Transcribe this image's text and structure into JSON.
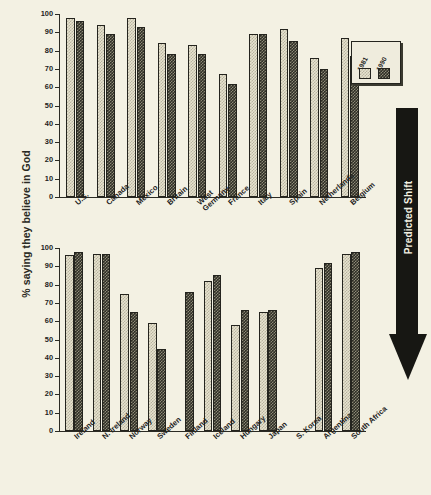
{
  "figure": {
    "ylabel": "% saying they believe in God",
    "annotation": "Predicted Shift",
    "background_color": "#f3f1e3",
    "bar_light_color": "#e6e3cf",
    "bar_dark_color": "#2e2e26",
    "arrow_color": "#171713"
  },
  "legend": {
    "entries": [
      {
        "label": "1981",
        "swatch": "light-checker-swatch"
      },
      {
        "label": "1990",
        "swatch": "dark-checker-swatch"
      }
    ]
  },
  "axis": {
    "ticks": [
      "0",
      "10",
      "20",
      "30",
      "40",
      "50",
      "60",
      "70",
      "80",
      "90",
      "100"
    ]
  },
  "chart_data": [
    {
      "type": "bar",
      "title": "",
      "panel": "top",
      "xlabel": "",
      "ylabel": "% saying they believe in God",
      "ylim": [
        0,
        100
      ],
      "yticks": [
        0,
        10,
        20,
        30,
        40,
        50,
        60,
        70,
        80,
        90,
        100
      ],
      "grid": false,
      "legend_position": "upper right",
      "categories": [
        "U.S.",
        "Canada",
        "Mexico",
        "Britain",
        "West\nGermany",
        "France",
        "Italy",
        "Spain",
        "Netherlands",
        "Belgium"
      ],
      "series": [
        {
          "name": "1981",
          "values": [
            98,
            94,
            98,
            84,
            83,
            67,
            89,
            92,
            76,
            87
          ]
        },
        {
          "name": "1990",
          "values": [
            96,
            89,
            93,
            78,
            78,
            62,
            89,
            85,
            70,
            77
          ]
        }
      ]
    },
    {
      "type": "bar",
      "title": "",
      "panel": "bottom",
      "xlabel": "",
      "ylabel": "% saying they believe in God",
      "ylim": [
        0,
        100
      ],
      "yticks": [
        0,
        10,
        20,
        30,
        40,
        50,
        60,
        70,
        80,
        90,
        100
      ],
      "grid": false,
      "legend_position": "none",
      "categories": [
        "Ireland",
        "N. Ireland",
        "Norway",
        "Sweden",
        "Finland",
        "Iceland",
        "Hungary",
        "Japan",
        "S. Korea",
        "Argentina",
        "South Africa"
      ],
      "series": [
        {
          "name": "1981",
          "values": [
            96,
            97,
            75,
            59,
            null,
            82,
            58,
            65,
            null,
            89,
            97
          ]
        },
        {
          "name": "1990",
          "values": [
            98,
            97,
            65,
            45,
            76,
            85,
            66,
            66,
            null,
            92,
            98
          ]
        }
      ]
    }
  ]
}
